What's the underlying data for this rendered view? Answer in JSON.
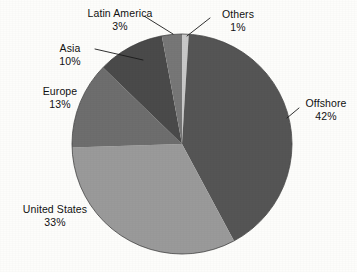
{
  "chart_data": {
    "type": "pie",
    "title": "",
    "legend_position": "outside-labels",
    "labels": [
      "Offshore",
      "United States",
      "Europe",
      "Asia",
      "Latin America",
      "Others"
    ],
    "values": [
      42,
      33,
      13,
      10,
      3,
      1
    ],
    "unit": "%",
    "start_angle_deg": 3.6,
    "direction": "clockwise",
    "colors": [
      "#555555",
      "#9a9a9a",
      "#6e6e6e",
      "#4a4a4a",
      "#777777",
      "#c9c9c9"
    ],
    "slices": [
      {
        "label": "Offshore",
        "value": 42,
        "display": "42%",
        "color": "#555555",
        "leader": true
      },
      {
        "label": "United States",
        "value": 33,
        "display": "33%",
        "color": "#9a9a9a",
        "leader": false
      },
      {
        "label": "Europe",
        "value": 13,
        "display": "13%",
        "color": "#6e6e6e",
        "leader": false
      },
      {
        "label": "Asia",
        "value": 10,
        "display": "10%",
        "color": "#4a4a4a",
        "leader": true
      },
      {
        "label": "Latin America",
        "value": 3,
        "display": "3%",
        "color": "#777777",
        "leader": true
      },
      {
        "label": "Others",
        "value": 1,
        "display": "1%",
        "color": "#c9c9c9",
        "leader": true
      }
    ]
  },
  "labels": {
    "latin_america": {
      "name": "Latin America",
      "value": "3%"
    },
    "others": {
      "name": "Others",
      "value": "1%"
    },
    "asia": {
      "name": "Asia",
      "value": "10%"
    },
    "europe": {
      "name": "Europe",
      "value": "13%"
    },
    "united_states": {
      "name": "United States",
      "value": "33%"
    },
    "offshore": {
      "name": "Offshore",
      "value": "42%"
    }
  },
  "style": {
    "background": "#fdfdfb",
    "text_color": "#111111",
    "outline_color": "#3a3a3a"
  }
}
